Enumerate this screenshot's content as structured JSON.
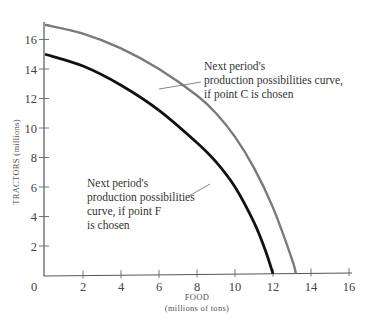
{
  "chart_data": {
    "type": "line",
    "title": "",
    "xlabel": "FOOD",
    "xlabel_sub": "(millions of tons)",
    "ylabel": "TRACTORS (millions)",
    "xlim": [
      0,
      16
    ],
    "ylim": [
      0,
      17
    ],
    "x_ticks": [
      0,
      2,
      4,
      6,
      8,
      10,
      12,
      14,
      16
    ],
    "y_ticks": [
      2,
      4,
      6,
      8,
      10,
      12,
      14,
      16
    ],
    "grid": false,
    "legend": "none (curves labeled by annotations)",
    "series": [
      {
        "name": "Next period's production possibilities curve, if point C is chosen",
        "color": "#7a7a7a",
        "points": [
          [
            0,
            17.0
          ],
          [
            2,
            16.4
          ],
          [
            4,
            15.4
          ],
          [
            6,
            14.0
          ],
          [
            8,
            12.2
          ],
          [
            9,
            11.0
          ],
          [
            10,
            9.4
          ],
          [
            11,
            7.3
          ],
          [
            12,
            4.6
          ],
          [
            13,
            1.1
          ],
          [
            13.2,
            0
          ]
        ]
      },
      {
        "name": "Next period's production possibilities curve, if point F is chosen",
        "color": "#111111",
        "points": [
          [
            0,
            15.0
          ],
          [
            2,
            14.2
          ],
          [
            4,
            12.9
          ],
          [
            6,
            11.2
          ],
          [
            8,
            9.0
          ],
          [
            9,
            7.7
          ],
          [
            10,
            6.0
          ],
          [
            11,
            3.6
          ],
          [
            11.6,
            1.7
          ],
          [
            12,
            0
          ]
        ]
      }
    ],
    "annotations": [
      {
        "lines": [
          "Next period's",
          "production possibilities curve,",
          "if point C is chosen"
        ],
        "target_series": 0
      },
      {
        "lines": [
          "Next period's",
          "production possibilities",
          "curve, if point F",
          "is chosen"
        ],
        "target_series": 1
      }
    ]
  },
  "labels": {
    "x_ticks": [
      "0",
      "2",
      "4",
      "6",
      "8",
      "10",
      "12",
      "14",
      "16"
    ],
    "y_ticks": [
      "2",
      "4",
      "6",
      "8",
      "10",
      "12",
      "14",
      "16"
    ],
    "x_title": "FOOD",
    "x_subtitle": "(millions of tons)",
    "y_title": "TRACTORS (millions)",
    "anno_c": [
      "Next period's",
      "production possibilities curve,",
      "if point C is chosen"
    ],
    "anno_f": [
      "Next period's",
      "production possibilities",
      "curve, if point F",
      "is chosen"
    ]
  }
}
